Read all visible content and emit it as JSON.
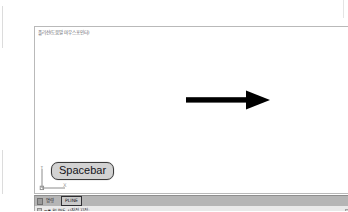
{
  "app": {
    "title": "CAD Drawing Window",
    "canvas_background": "#ffffff",
    "frame_border_color": "#b9b9b9"
  },
  "canvas": {
    "caption": "폴리선(도움말 마우스포인터)",
    "annotation": {
      "type": "arrow",
      "direction": "right",
      "label": "right-arrow",
      "color": "#000000"
    }
  },
  "ucs_icon": {
    "name": "ucs-axis-icon",
    "x_axis_label": "X",
    "y_axis_label": "Y",
    "origin_label": "0"
  },
  "callout": {
    "key_label": "Spacebar",
    "fill_color": "#d2d2d2",
    "border_color": "#3a3a3a"
  },
  "status_strip": {
    "background_color": "#b5b5b5",
    "mode_label": "명령",
    "active_command": "PLINE"
  },
  "command_bar": {
    "prompt": "⌐▪ PLINE 시작점 지정:",
    "background_color": "#e9e9e9"
  }
}
